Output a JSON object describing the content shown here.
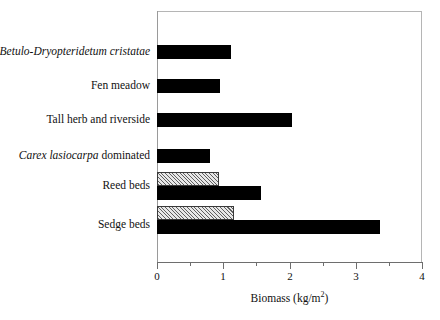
{
  "chart_data": {
    "type": "bar",
    "orientation": "horizontal",
    "title": "",
    "subtitle": "",
    "xlabel": "Biomass (kg/m2)",
    "xlabel_base": "Biomass (kg/m",
    "xlabel_sup": "2",
    "xlabel_tail": ")",
    "ylabel": "",
    "xlim": [
      0,
      4
    ],
    "xticks": [
      0,
      1,
      2,
      3,
      4
    ],
    "xtick_labels": [
      "0",
      "1",
      "2",
      "3",
      "4"
    ],
    "xminor_ticks": [
      0.5,
      1.5,
      2.5,
      3.5
    ],
    "grid": false,
    "legend": false,
    "categories": [
      "Betulo-Dryopteridetum cristatae",
      "Fen meadow",
      "Tall herb and riverside",
      "Carex lasiocarpa dominated",
      "Reed beds",
      "Sedge beds"
    ],
    "series": [
      {
        "name": "solid",
        "fill": "black-solid",
        "values": [
          1.12,
          0.95,
          2.04,
          0.8,
          1.57,
          3.37
        ]
      },
      {
        "name": "hatched",
        "fill": "diagonal-hatch",
        "values": [
          null,
          null,
          null,
          null,
          0.94,
          1.16
        ]
      }
    ],
    "colors": {
      "solid_fill": "#000000",
      "hatch_fill": "#e8e8e8",
      "hatch_line": "#5f5f5f",
      "axis": "#6e6e6e",
      "frame": "#9a9a9a",
      "text": "#111111",
      "background": "#ffffff"
    }
  },
  "labels": {
    "rows": [
      {
        "id": "betulo-dryopteridetum-cristatae",
        "italic_part": "Betulo-Dryopteridetum cristatae",
        "roman_part": ""
      },
      {
        "id": "fen-meadow",
        "italic_part": "",
        "roman_part": "Fen meadow"
      },
      {
        "id": "tall-herb-and-riverside",
        "italic_part": "",
        "roman_part": "Tall herb and riverside"
      },
      {
        "id": "carex-lasiocarpa-dominated",
        "italic_part": "Carex lasiocarpa",
        "roman_part": " dominated"
      },
      {
        "id": "reed-beds",
        "italic_part": "",
        "roman_part": "Reed beds"
      },
      {
        "id": "sedge-beds",
        "italic_part": "",
        "roman_part": "Sedge beds"
      }
    ]
  }
}
